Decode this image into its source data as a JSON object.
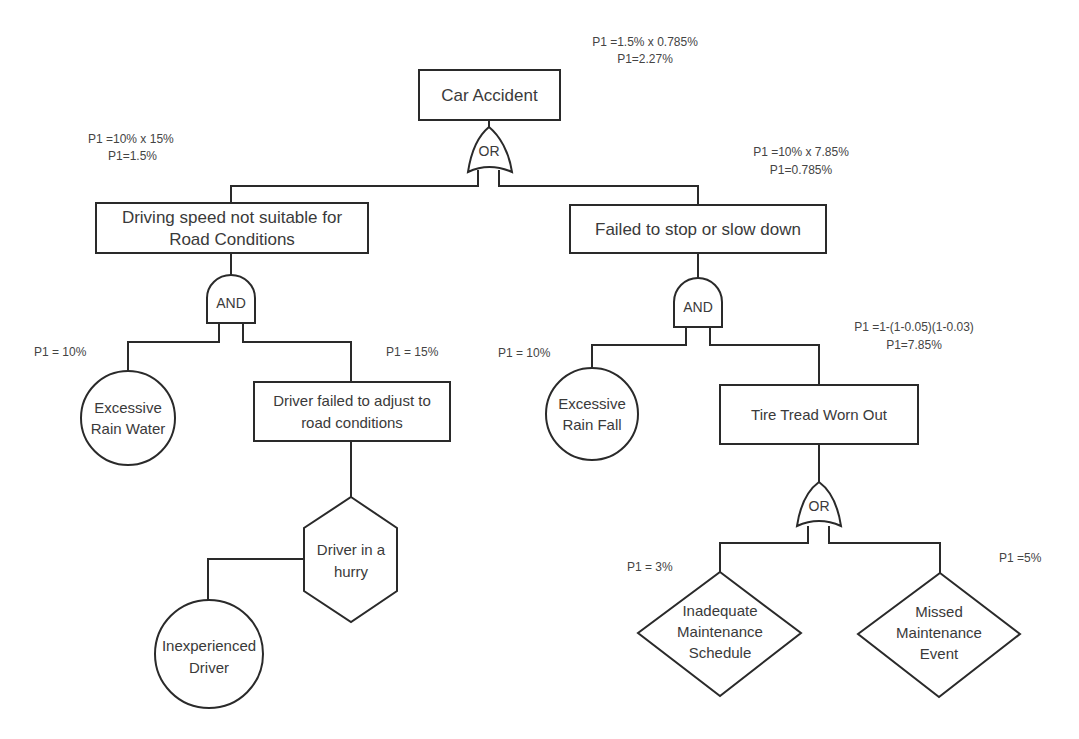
{
  "colors": {
    "line": "#2a2a2a",
    "text": "#3a3a3a",
    "background": "#ffffff"
  },
  "top_event": {
    "label": "Car Accident",
    "prob": [
      "P1 =1.5% x 0.785%",
      "P1=2.27%"
    ],
    "gate": "OR"
  },
  "left_branch": {
    "label_lines": [
      "Driving speed not suitable for",
      "Road Conditions"
    ],
    "prob": [
      "P1 =10% x 15%",
      "P1=1.5%"
    ],
    "gate": "AND",
    "basic_event": {
      "label_lines": [
        "Excessive",
        "Rain Water"
      ],
      "prob": "P1 = 10%",
      "shape": "circle"
    },
    "intermediate": {
      "label_lines": [
        "Driver failed to adjust to",
        "road conditions"
      ],
      "prob": "P1 = 15%",
      "condition": {
        "label_lines": [
          "Driver in a",
          "hurry"
        ],
        "shape": "hexagon"
      },
      "basic_event": {
        "label_lines": [
          "Inexperienced",
          "Driver"
        ],
        "shape": "circle"
      }
    }
  },
  "right_branch": {
    "label": "Failed to stop or slow down",
    "prob": [
      "P1 =10% x 7.85%",
      "P1=0.785%"
    ],
    "gate": "AND",
    "basic_event": {
      "label_lines": [
        "Excessive",
        "Rain Fall"
      ],
      "prob": "P1 = 10%",
      "shape": "circle"
    },
    "intermediate": {
      "label": "Tire Tread Worn Out",
      "prob": [
        "P1 =1-(1-0.05)(1-0.03)",
        "P1=7.85%"
      ],
      "gate": "OR",
      "undeveloped_events": [
        {
          "label_lines": [
            "Inadequate",
            "Maintenance",
            "Schedule"
          ],
          "prob": "P1 = 3%",
          "shape": "diamond"
        },
        {
          "label_lines": [
            "Missed",
            "Maintenance",
            "Event"
          ],
          "prob": "P1 =5%",
          "shape": "diamond"
        }
      ]
    }
  }
}
